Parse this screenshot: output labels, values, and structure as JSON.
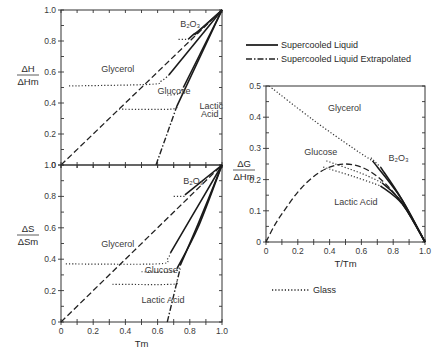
{
  "chart_data": [
    {
      "id": "enthalpy",
      "type": "line",
      "ylabel_num": "ΔH",
      "ylabel_den": "ΔHm",
      "xlabel": "",
      "xlim": [
        0,
        1.0
      ],
      "ylim": [
        0,
        1.0
      ],
      "yticks": [
        "0",
        "0.2",
        "0.4",
        "0.6",
        "0.8",
        "1.0"
      ],
      "xticks": [],
      "frame": {
        "x0": 61,
        "x1": 222,
        "y0": 165,
        "y1": 10
      },
      "series": [
        {
          "name": "reference-diagonal",
          "style": "dashed",
          "points": [
            [
              0,
              0
            ],
            [
              1,
              1
            ]
          ]
        },
        {
          "name": "B2O3",
          "glass": [
            [
              0.73,
              0.81
            ],
            [
              0.79,
              0.81
            ]
          ],
          "curve": [
            [
              0.79,
              0.81
            ],
            [
              0.82,
              0.84
            ],
            [
              0.86,
              0.87
            ],
            [
              1,
              1
            ]
          ],
          "style": "solid"
        },
        {
          "name": "Glycerol",
          "glass": [
            [
              0.05,
              0.51
            ],
            [
              0.55,
              0.52
            ],
            [
              0.62,
              0.54
            ],
            [
              0.67,
              0.58
            ]
          ],
          "curve": [
            [
              0.67,
              0.58
            ],
            [
              1,
              1
            ]
          ],
          "style": "solid"
        },
        {
          "name": "Glucose",
          "glass": [
            [
              0.66,
              0.45
            ],
            [
              0.73,
              0.46
            ],
            [
              0.76,
              0.5
            ]
          ],
          "curve": [
            [
              0.76,
              0.5
            ],
            [
              1,
              1
            ]
          ],
          "style": "solid"
        },
        {
          "name": "Lactic Acid",
          "glass": [
            [
              0.36,
              0.36
            ],
            [
              0.68,
              0.36
            ],
            [
              0.72,
              0.38
            ]
          ],
          "curve": [
            [
              0.72,
              0.38
            ],
            [
              1,
              1
            ]
          ],
          "style": "solid"
        },
        {
          "name": "Lactic Acid extrapolated",
          "style": "dashdot",
          "points": [
            [
              0.59,
              0
            ],
            [
              0.72,
              0.38
            ]
          ]
        },
        {
          "name": "B2O3 upper",
          "style": "solid",
          "points": [
            [
              0.83,
              0.84
            ],
            [
              1,
              1
            ]
          ]
        }
      ],
      "annotations": [
        {
          "text": "B₂O₃",
          "x": 0.74,
          "y": 0.89
        },
        {
          "text": "Glycerol",
          "x": 0.25,
          "y": 0.6
        },
        {
          "text": "Glucose",
          "x": 0.6,
          "y": 0.46
        },
        {
          "text": "Lactic",
          "x": 0.86,
          "y": 0.36
        },
        {
          "text": "Acid",
          "x": 0.87,
          "y": 0.31
        }
      ]
    },
    {
      "id": "entropy",
      "type": "line",
      "ylabel_num": "ΔS",
      "ylabel_den": "ΔSm",
      "xlabel": "Tm",
      "xlim": [
        0,
        1.0
      ],
      "ylim": [
        0,
        1.0
      ],
      "yticks": [
        "0",
        "0.2",
        "0.4",
        "0.6",
        "0.8",
        "1.0"
      ],
      "xticks": [
        "0",
        "0.2",
        "0.4",
        "0.6",
        "0.8",
        "1.0"
      ],
      "frame": {
        "x0": 61,
        "x1": 222,
        "y0": 322,
        "y1": 165
      },
      "series": [
        {
          "name": "reference-diagonal",
          "style": "dashed",
          "points": [
            [
              0,
              0
            ],
            [
              1,
              1
            ]
          ]
        },
        {
          "name": "B2O3",
          "glass": [
            [
              0.7,
              0.8
            ],
            [
              0.77,
              0.8
            ]
          ],
          "curve": [
            [
              0.77,
              0.81
            ],
            [
              1,
              1
            ]
          ],
          "style": "solid"
        },
        {
          "name": "Glycerol",
          "glass": [
            [
              0.03,
              0.37
            ],
            [
              0.6,
              0.37
            ],
            [
              0.66,
              0.4
            ],
            [
              0.68,
              0.44
            ]
          ],
          "curve": [
            [
              0.68,
              0.44
            ],
            [
              0.8,
              0.65
            ],
            [
              1,
              1
            ]
          ],
          "style": "solid"
        },
        {
          "name": "Glucose",
          "glass": [
            [
              0.5,
              0.32
            ],
            [
              0.7,
              0.32
            ],
            [
              0.74,
              0.36
            ]
          ],
          "curve": [
            [
              0.74,
              0.36
            ],
            [
              0.85,
              0.62
            ],
            [
              1,
              1
            ]
          ],
          "style": "solid"
        },
        {
          "name": "Lactic Acid",
          "glass": [
            [
              0.32,
              0.24
            ],
            [
              0.69,
              0.24
            ],
            [
              0.72,
              0.26
            ]
          ],
          "curve": [
            [
              0.72,
              0.34
            ],
            [
              0.85,
              0.6
            ],
            [
              1,
              1
            ]
          ],
          "style": "solid"
        },
        {
          "name": "Lactic Acid extrapolated",
          "style": "dashdot",
          "points": [
            [
              0.66,
              0
            ],
            [
              0.74,
              0.34
            ]
          ]
        }
      ],
      "annotations": [
        {
          "text": "B₂O₃",
          "x": 0.76,
          "y": 0.88
        },
        {
          "text": "Glycerol",
          "x": 0.25,
          "y": 0.48
        },
        {
          "text": "Glucose",
          "x": 0.52,
          "y": 0.31
        },
        {
          "text": "Lactic Acid",
          "x": 0.5,
          "y": 0.12
        }
      ]
    },
    {
      "id": "gibbs",
      "type": "line",
      "ylabel_num": "ΔG",
      "ylabel_den": "ΔHm",
      "xlabel": "T/Tm",
      "xlim": [
        0,
        1.0
      ],
      "ylim": [
        0,
        0.5
      ],
      "yticks": [
        "0",
        "0.1",
        "0.2",
        "0.3",
        "0.4",
        "0.5"
      ],
      "xticks": [
        "0",
        "0.2",
        "0.4",
        "0.6",
        "0.8",
        "1.0"
      ],
      "frame": {
        "x0": 266,
        "x1": 425,
        "y0": 242,
        "y1": 86
      },
      "series": [
        {
          "name": "reference-parabola",
          "style": "dashed",
          "points": [
            [
              0,
              0
            ],
            [
              0.05,
              0.05
            ],
            [
              0.1,
              0.09
            ],
            [
              0.2,
              0.16
            ],
            [
              0.3,
              0.21
            ],
            [
              0.4,
              0.24
            ],
            [
              0.5,
              0.25
            ],
            [
              0.6,
              0.24
            ],
            [
              0.7,
              0.21
            ],
            [
              0.8,
              0.16
            ],
            [
              0.9,
              0.09
            ],
            [
              1,
              0
            ]
          ]
        },
        {
          "name": "Glycerol",
          "glass": [
            [
              0.02,
              0.5
            ],
            [
              0.3,
              0.39
            ],
            [
              0.55,
              0.3
            ],
            [
              0.67,
              0.26
            ]
          ],
          "curve": [
            [
              0.67,
              0.26
            ],
            [
              0.85,
              0.14
            ],
            [
              1,
              0
            ]
          ],
          "style": "solid"
        },
        {
          "name": "B2O3",
          "glass": [
            [
              0.66,
              0.27
            ],
            [
              0.72,
              0.24
            ]
          ],
          "curve": [
            [
              0.72,
              0.24
            ],
            [
              0.85,
              0.14
            ],
            [
              1,
              0
            ]
          ],
          "style": "solid"
        },
        {
          "name": "Glucose",
          "glass": [
            [
              0.38,
              0.26
            ],
            [
              0.6,
              0.22
            ],
            [
              0.73,
              0.19
            ]
          ],
          "curve": [
            [
              0.73,
              0.19
            ],
            [
              0.85,
              0.13
            ],
            [
              1,
              0
            ]
          ],
          "style": "solid"
        },
        {
          "name": "Lactic Acid",
          "glass": [
            [
              0.36,
              0.24
            ],
            [
              0.55,
              0.21
            ],
            [
              0.72,
              0.18
            ]
          ],
          "curve": [
            [
              0.72,
              0.18
            ],
            [
              0.86,
              0.12
            ],
            [
              1,
              0
            ]
          ],
          "style": "solid"
        }
      ],
      "annotations": [
        {
          "text": "Glycerol",
          "x": 0.39,
          "y": 0.42
        },
        {
          "text": "Glucose",
          "x": 0.24,
          "y": 0.28
        },
        {
          "text": "B₂O₃",
          "x": 0.77,
          "y": 0.26
        },
        {
          "text": "Lactic Acid",
          "x": 0.43,
          "y": 0.12
        }
      ]
    }
  ],
  "legend": {
    "items": [
      {
        "label": "Supercooled Liquid",
        "style": "solid"
      },
      {
        "label": "Supercooled Liquid Extrapolated",
        "style": "dashdot"
      },
      {
        "label": "Glass",
        "style": "dotted"
      }
    ]
  }
}
